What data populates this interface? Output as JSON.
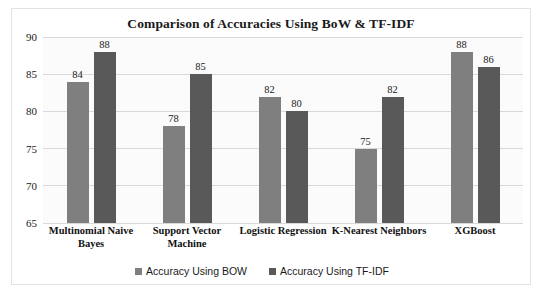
{
  "chart_data": {
    "type": "bar",
    "title": "Comparison of Accuracies Using BoW & TF-IDF",
    "xlabel": "",
    "ylabel": "",
    "ylim": [
      65,
      90
    ],
    "yticks": [
      65,
      70,
      75,
      80,
      85,
      90
    ],
    "grid": true,
    "legend_position": "bottom",
    "categories": [
      "Multinomial Naive Bayes",
      "Support Vector Machine",
      "Logistic Regression",
      "K-Nearest Neighbors",
      "XGBoost"
    ],
    "series": [
      {
        "name": "Accuracy Using BOW",
        "color": "#7f7f7f",
        "values": [
          84,
          78,
          82,
          75,
          88
        ]
      },
      {
        "name": "Accuracy Using TF-IDF",
        "color": "#595959",
        "values": [
          88,
          85,
          80,
          82,
          86
        ]
      }
    ]
  },
  "legend": {
    "items": [
      {
        "label": "Accuracy Using BOW",
        "color": "#7f7f7f"
      },
      {
        "label": "Accuracy Using TF-IDF",
        "color": "#595959"
      }
    ]
  }
}
